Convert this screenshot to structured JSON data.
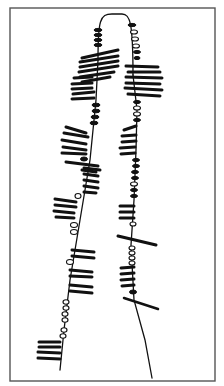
{
  "figure": {
    "title": "",
    "frame": {
      "x": 10,
      "y": 8,
      "w": 205,
      "h": 373,
      "color": "#555555"
    },
    "ink_color": "#111111",
    "bridge": "M98,60 C98,20 100,14 112,14 L122,14 C130,14 133,22 133,75",
    "left_strand": {
      "axis": "M98,60 L96,100 L90,160 L80,220 L70,280 L64,330 L60,370",
      "loops": [
        {
          "x1": 82,
          "y1": 58,
          "x2": 118,
          "y2": 50,
          "w": 3
        },
        {
          "x1": 80,
          "y1": 62,
          "x2": 118,
          "y2": 56,
          "w": 3
        },
        {
          "x1": 80,
          "y1": 67,
          "x2": 118,
          "y2": 61,
          "w": 3
        },
        {
          "x1": 79,
          "y1": 72,
          "x2": 118,
          "y2": 66,
          "w": 3
        },
        {
          "x1": 80,
          "y1": 77,
          "x2": 114,
          "y2": 72,
          "w": 3
        },
        {
          "x1": 82,
          "y1": 82,
          "x2": 110,
          "y2": 77,
          "w": 3
        },
        {
          "x1": 74,
          "y1": 78,
          "x2": 92,
          "y2": 77,
          "w": 3
        },
        {
          "x1": 72,
          "y1": 84,
          "x2": 92,
          "y2": 83,
          "w": 3
        },
        {
          "x1": 72,
          "y1": 89,
          "x2": 92,
          "y2": 88,
          "w": 3
        },
        {
          "x1": 73,
          "y1": 94,
          "x2": 94,
          "y2": 92,
          "w": 3
        },
        {
          "x1": 72,
          "y1": 99,
          "x2": 94,
          "y2": 98,
          "w": 3
        },
        {
          "x1": 66,
          "y1": 127,
          "x2": 86,
          "y2": 133,
          "w": 3
        },
        {
          "x1": 64,
          "y1": 133,
          "x2": 88,
          "y2": 137,
          "w": 3
        },
        {
          "x1": 62,
          "y1": 140,
          "x2": 86,
          "y2": 144,
          "w": 3
        },
        {
          "x1": 63,
          "y1": 147,
          "x2": 86,
          "y2": 150,
          "w": 3
        },
        {
          "x1": 62,
          "y1": 153,
          "x2": 86,
          "y2": 154,
          "w": 3
        },
        {
          "x1": 66,
          "y1": 162,
          "x2": 98,
          "y2": 166,
          "w": 3
        },
        {
          "x1": 84,
          "y1": 168,
          "x2": 100,
          "y2": 170,
          "w": 3
        },
        {
          "x1": 84,
          "y1": 174,
          "x2": 98,
          "y2": 176,
          "w": 3
        },
        {
          "x1": 84,
          "y1": 180,
          "x2": 98,
          "y2": 182,
          "w": 3
        },
        {
          "x1": 84,
          "y1": 186,
          "x2": 98,
          "y2": 188,
          "w": 3
        },
        {
          "x1": 84,
          "y1": 192,
          "x2": 96,
          "y2": 193,
          "w": 3
        },
        {
          "x1": 82,
          "y1": 170,
          "x2": 96,
          "y2": 172,
          "w": 3
        },
        {
          "x1": 55,
          "y1": 199,
          "x2": 76,
          "y2": 202,
          "w": 3
        },
        {
          "x1": 55,
          "y1": 205,
          "x2": 76,
          "y2": 207,
          "w": 3
        },
        {
          "x1": 54,
          "y1": 211,
          "x2": 74,
          "y2": 213,
          "w": 3
        },
        {
          "x1": 56,
          "y1": 217,
          "x2": 74,
          "y2": 218,
          "w": 3
        },
        {
          "x1": 72,
          "y1": 250,
          "x2": 94,
          "y2": 252,
          "w": 3
        },
        {
          "x1": 72,
          "y1": 256,
          "x2": 94,
          "y2": 258,
          "w": 3
        },
        {
          "x1": 70,
          "y1": 270,
          "x2": 92,
          "y2": 272,
          "w": 3
        },
        {
          "x1": 70,
          "y1": 276,
          "x2": 92,
          "y2": 277,
          "w": 3
        },
        {
          "x1": 70,
          "y1": 285,
          "x2": 92,
          "y2": 287,
          "w": 3
        },
        {
          "x1": 70,
          "y1": 291,
          "x2": 92,
          "y2": 293,
          "w": 3
        },
        {
          "x1": 39,
          "y1": 342,
          "x2": 60,
          "y2": 342,
          "w": 3
        },
        {
          "x1": 39,
          "y1": 347,
          "x2": 60,
          "y2": 347,
          "w": 3
        },
        {
          "x1": 38,
          "y1": 352,
          "x2": 60,
          "y2": 353,
          "w": 3
        },
        {
          "x1": 38,
          "y1": 358,
          "x2": 60,
          "y2": 359,
          "w": 3
        }
      ],
      "beads": [
        {
          "cx": 98,
          "cy": 30,
          "rx": 4,
          "ry": 1.6,
          "solid": true
        },
        {
          "cx": 98,
          "cy": 35,
          "rx": 4,
          "ry": 1.6,
          "solid": true
        },
        {
          "cx": 98,
          "cy": 40,
          "rx": 4,
          "ry": 1.6,
          "solid": true
        },
        {
          "cx": 98,
          "cy": 45,
          "rx": 4,
          "ry": 1.6,
          "solid": true
        },
        {
          "cx": 96,
          "cy": 105,
          "rx": 4,
          "ry": 1.8,
          "solid": true
        },
        {
          "cx": 96,
          "cy": 111,
          "rx": 4,
          "ry": 1.8,
          "solid": true
        },
        {
          "cx": 95,
          "cy": 117,
          "rx": 4,
          "ry": 1.8,
          "solid": true
        },
        {
          "cx": 94,
          "cy": 123,
          "rx": 4,
          "ry": 1.8,
          "solid": true
        },
        {
          "cx": 84,
          "cy": 159,
          "rx": 3.5,
          "ry": 2,
          "solid": true
        },
        {
          "cx": 78,
          "cy": 196,
          "rx": 3,
          "ry": 2.5,
          "solid": false
        },
        {
          "cx": 74,
          "cy": 225,
          "rx": 3.5,
          "ry": 2.5,
          "solid": false
        },
        {
          "cx": 74,
          "cy": 232,
          "rx": 3.5,
          "ry": 2.5,
          "solid": false
        },
        {
          "cx": 70,
          "cy": 262,
          "rx": 3.5,
          "ry": 2.5,
          "solid": false
        },
        {
          "cx": 66,
          "cy": 302,
          "rx": 3,
          "ry": 2.2,
          "solid": false
        },
        {
          "cx": 66,
          "cy": 308,
          "rx": 3,
          "ry": 2.2,
          "solid": false
        },
        {
          "cx": 65,
          "cy": 314,
          "rx": 3,
          "ry": 2.2,
          "solid": false
        },
        {
          "cx": 65,
          "cy": 320,
          "rx": 3,
          "ry": 2.2,
          "solid": false
        },
        {
          "cx": 64,
          "cy": 330,
          "rx": 3,
          "ry": 2.2,
          "solid": false
        },
        {
          "cx": 63,
          "cy": 336,
          "rx": 3,
          "ry": 2.2,
          "solid": false
        }
      ]
    },
    "right_strand": {
      "axis": "M133,75 L137,110 L136,150 L134,200 L131,245 L134,300 L145,340 L152,378",
      "loops": [
        {
          "x1": 126,
          "y1": 66,
          "x2": 158,
          "y2": 67,
          "w": 3
        },
        {
          "x1": 128,
          "y1": 72,
          "x2": 160,
          "y2": 72,
          "w": 3
        },
        {
          "x1": 126,
          "y1": 77,
          "x2": 162,
          "y2": 78,
          "w": 3
        },
        {
          "x1": 126,
          "y1": 83,
          "x2": 160,
          "y2": 84,
          "w": 3
        },
        {
          "x1": 125,
          "y1": 88,
          "x2": 162,
          "y2": 90,
          "w": 3
        },
        {
          "x1": 128,
          "y1": 94,
          "x2": 160,
          "y2": 96,
          "w": 3
        },
        {
          "x1": 124,
          "y1": 130,
          "x2": 136,
          "y2": 126,
          "w": 3
        },
        {
          "x1": 122,
          "y1": 136,
          "x2": 136,
          "y2": 135,
          "w": 3
        },
        {
          "x1": 122,
          "y1": 142,
          "x2": 136,
          "y2": 141,
          "w": 3
        },
        {
          "x1": 120,
          "y1": 148,
          "x2": 135,
          "y2": 147,
          "w": 3
        },
        {
          "x1": 121,
          "y1": 154,
          "x2": 135,
          "y2": 153,
          "w": 3
        },
        {
          "x1": 120,
          "y1": 206,
          "x2": 134,
          "y2": 206,
          "w": 3
        },
        {
          "x1": 120,
          "y1": 212,
          "x2": 134,
          "y2": 212,
          "w": 3
        },
        {
          "x1": 120,
          "y1": 218,
          "x2": 134,
          "y2": 218,
          "w": 3
        },
        {
          "x1": 118,
          "y1": 236,
          "x2": 156,
          "y2": 245,
          "w": 3
        },
        {
          "x1": 121,
          "y1": 268,
          "x2": 134,
          "y2": 267,
          "w": 3
        },
        {
          "x1": 121,
          "y1": 274,
          "x2": 134,
          "y2": 273,
          "w": 3
        },
        {
          "x1": 121,
          "y1": 280,
          "x2": 134,
          "y2": 279,
          "w": 3
        },
        {
          "x1": 122,
          "y1": 286,
          "x2": 134,
          "y2": 285,
          "w": 3
        },
        {
          "x1": 124,
          "y1": 298,
          "x2": 158,
          "y2": 309,
          "w": 2.5
        }
      ],
      "beads": [
        {
          "cx": 132,
          "cy": 25,
          "rx": 4,
          "ry": 1.6,
          "solid": true
        },
        {
          "cx": 134,
          "cy": 32,
          "rx": 3.5,
          "ry": 2,
          "solid": false
        },
        {
          "cx": 135,
          "cy": 39,
          "rx": 3.5,
          "ry": 2,
          "solid": false
        },
        {
          "cx": 136,
          "cy": 46,
          "rx": 3.5,
          "ry": 2,
          "solid": false
        },
        {
          "cx": 137,
          "cy": 52,
          "rx": 3.5,
          "ry": 1.6,
          "solid": true
        },
        {
          "cx": 137,
          "cy": 58,
          "rx": 3,
          "ry": 1.6,
          "solid": true
        },
        {
          "cx": 137,
          "cy": 102,
          "rx": 3.5,
          "ry": 1.6,
          "solid": true
        },
        {
          "cx": 137,
          "cy": 108,
          "rx": 3.5,
          "ry": 2,
          "solid": false
        },
        {
          "cx": 137,
          "cy": 114,
          "rx": 3.5,
          "ry": 2,
          "solid": false
        },
        {
          "cx": 137,
          "cy": 120,
          "rx": 3.5,
          "ry": 1.6,
          "solid": true
        },
        {
          "cx": 136,
          "cy": 160,
          "rx": 3.5,
          "ry": 1.6,
          "solid": true
        },
        {
          "cx": 136,
          "cy": 166,
          "rx": 3.5,
          "ry": 1.6,
          "solid": true
        },
        {
          "cx": 135,
          "cy": 172,
          "rx": 3.5,
          "ry": 1.6,
          "solid": true
        },
        {
          "cx": 135,
          "cy": 178,
          "rx": 3.5,
          "ry": 1.6,
          "solid": true
        },
        {
          "cx": 134,
          "cy": 184,
          "rx": 3.5,
          "ry": 2,
          "solid": false
        },
        {
          "cx": 134,
          "cy": 190,
          "rx": 3.5,
          "ry": 1.6,
          "solid": true
        },
        {
          "cx": 134,
          "cy": 196,
          "rx": 3.5,
          "ry": 1.6,
          "solid": true
        },
        {
          "cx": 133,
          "cy": 224,
          "rx": 3,
          "ry": 2,
          "solid": false
        },
        {
          "cx": 132,
          "cy": 248,
          "rx": 3,
          "ry": 2,
          "solid": false
        },
        {
          "cx": 132,
          "cy": 253,
          "rx": 3,
          "ry": 2,
          "solid": false
        },
        {
          "cx": 132,
          "cy": 258,
          "rx": 3,
          "ry": 2,
          "solid": false
        },
        {
          "cx": 132,
          "cy": 263,
          "rx": 3,
          "ry": 2,
          "solid": false
        },
        {
          "cx": 133,
          "cy": 292,
          "rx": 3.5,
          "ry": 2,
          "solid": true
        }
      ]
    }
  }
}
